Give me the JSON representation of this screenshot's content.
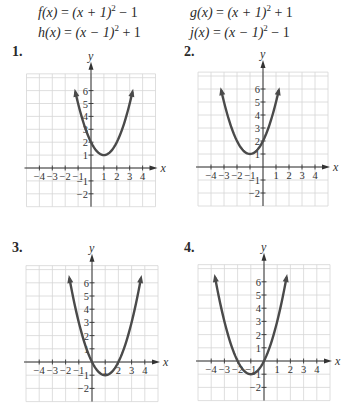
{
  "equations": {
    "f": {
      "name": "f(x)",
      "rhs_pre": "(x + 1)",
      "exp": "2",
      "rhs_post": " − 1"
    },
    "g": {
      "name": "g(x)",
      "rhs_pre": "(x + 1)",
      "exp": "2",
      "rhs_post": " + 1"
    },
    "h": {
      "name": "h(x)",
      "rhs_pre": "(x − 1)",
      "exp": "2",
      "rhs_post": " + 1"
    },
    "j": {
      "name": "j(x)",
      "rhs_pre": "(x − 1)",
      "exp": "2",
      "rhs_post": " − 1"
    }
  },
  "colors": {
    "curve": "#4a4a4a",
    "grid": "#d6d6d6",
    "axis": "#333333",
    "text": "#2a2a2a"
  },
  "chart_data": [
    {
      "type": "line",
      "label": "1.",
      "function": "y = (x - 1)^2 + 1",
      "vertex": [
        1,
        1
      ],
      "x": [
        -1.2,
        -1,
        0,
        1,
        2,
        3,
        3.2
      ],
      "y": [
        5.84,
        5,
        2,
        1,
        2,
        5,
        5.84
      ],
      "xlabel": "x",
      "ylabel": "y",
      "xticks": [
        "-4",
        "-3",
        "-2",
        "-1",
        "1",
        "2",
        "3",
        "4"
      ],
      "yticks": [
        "-2",
        "-1",
        "1",
        "2",
        "3",
        "4",
        "5",
        "6"
      ],
      "xlim": [
        -5,
        5
      ],
      "ylim": [
        -3,
        7.3
      ],
      "grid": true
    },
    {
      "type": "line",
      "label": "2.",
      "function": "y = (x + 1)^2 + 1",
      "vertex": [
        -1,
        1
      ],
      "x": [
        -3.2,
        -3,
        -2,
        -1,
        0,
        1,
        1.2
      ],
      "y": [
        5.84,
        5,
        2,
        1,
        2,
        5,
        5.84
      ],
      "xlabel": "x",
      "ylabel": "y",
      "xticks": [
        "-4",
        "-3",
        "-2",
        "-1",
        "1",
        "2",
        "3",
        "4"
      ],
      "yticks": [
        "-2",
        "-1",
        "1",
        "2",
        "3",
        "4",
        "5",
        "6"
      ],
      "xlim": [
        -5,
        5
      ],
      "ylim": [
        -3,
        7.3
      ],
      "grid": true
    },
    {
      "type": "line",
      "label": "3.",
      "function": "y = (x - 1)^2 - 1",
      "vertex": [
        1,
        -1
      ],
      "x": [
        -1.7,
        -1,
        0,
        1,
        2,
        3,
        3.7
      ],
      "y": [
        6.29,
        3,
        0,
        -1,
        0,
        3,
        6.29
      ],
      "xlabel": "x",
      "ylabel": "y",
      "xticks": [
        "-4",
        "-3",
        "-2",
        "-1",
        "1",
        "2",
        "3",
        "4"
      ],
      "yticks": [
        "-2",
        "-1",
        "1",
        "2",
        "3",
        "4",
        "5",
        "6"
      ],
      "xlim": [
        -5,
        5
      ],
      "ylim": [
        -3,
        7.3
      ],
      "grid": true
    },
    {
      "type": "line",
      "label": "4.",
      "function": "y = (x + 1)^2 - 1",
      "vertex": [
        -1,
        -1
      ],
      "x": [
        -3.7,
        -3,
        -2,
        -1,
        0,
        1,
        1.7
      ],
      "y": [
        6.29,
        3,
        0,
        -1,
        0,
        3,
        6.29
      ],
      "xlabel": "x",
      "ylabel": "y",
      "xticks": [
        "-4",
        "-3",
        "-2",
        "-1",
        "1",
        "2",
        "3",
        "4"
      ],
      "yticks": [
        "-2",
        "-1",
        "1",
        "2",
        "3",
        "4",
        "5",
        "6"
      ],
      "xlim": [
        -5,
        5
      ],
      "ylim": [
        -3,
        7.3
      ],
      "grid": true
    }
  ],
  "layout": {
    "plots": [
      {
        "ox": 91,
        "oy": 168,
        "unit": 12.9,
        "labelX": 14,
        "labelY": 52
      },
      {
        "ox": 263,
        "oy": 167,
        "unit": 13.0,
        "labelX": 184,
        "labelY": 52
      },
      {
        "ox": 92,
        "oy": 362,
        "unit": 13.2,
        "labelX": 14,
        "labelY": 246
      },
      {
        "ox": 264,
        "oy": 361,
        "unit": 13.2,
        "labelX": 184,
        "labelY": 246
      }
    ]
  }
}
